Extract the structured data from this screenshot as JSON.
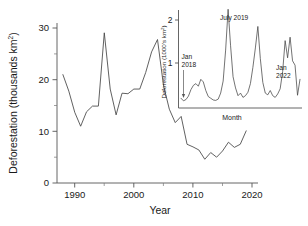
{
  "chart_data": [
    {
      "id": "main",
      "type": "line",
      "title": "",
      "xlabel": "Year",
      "ylabel": "Deforestation (thousands km²)",
      "ylabel_base": "Deforestation (thousands km",
      "ylabel_sup": "2",
      "ylabel_tail": ")",
      "xlim": [
        1987,
        2021
      ],
      "ylim": [
        0,
        31
      ],
      "xticks": [
        1990,
        2000,
        2010,
        2020
      ],
      "xtick_labels": [
        "1990",
        "2000",
        "2010",
        "2020"
      ],
      "xminorticks": [
        1995,
        2005,
        2015
      ],
      "yticks": [
        0,
        10,
        20,
        30
      ],
      "ytick_labels": [
        "0",
        "10",
        "20",
        "30"
      ],
      "yminorticks": [
        5,
        15,
        25
      ],
      "grid": false,
      "legend": "none",
      "x": [
        1988,
        1989,
        1990,
        1991,
        1992,
        1993,
        1994,
        1995,
        1996,
        1997,
        1998,
        1999,
        2000,
        2001,
        2002,
        2003,
        2004,
        2005,
        2006,
        2007,
        2008,
        2009,
        2010,
        2011,
        2012,
        2013,
        2014,
        2015,
        2016,
        2017,
        2018,
        2019
      ],
      "values": [
        21.0,
        17.8,
        13.7,
        11.0,
        13.8,
        14.9,
        14.9,
        29.1,
        18.2,
        13.2,
        17.4,
        17.3,
        18.2,
        18.2,
        21.4,
        25.4,
        27.8,
        19.0,
        14.3,
        11.7,
        12.9,
        7.5,
        7.0,
        6.4,
        4.6,
        5.9,
        5.0,
        6.2,
        7.9,
        6.9,
        7.5,
        10.1
      ]
    },
    {
      "id": "inset",
      "type": "line",
      "title": "",
      "xlabel": "Month",
      "ylabel": "Deforestation (1000's km²)",
      "ylabel_base": "Deforestation (1000's km",
      "ylabel_sup": "2",
      "ylabel_tail": ")",
      "ylim": [
        0,
        2.3
      ],
      "yticks": [
        1,
        2
      ],
      "ytick_labels": [
        "1",
        "2"
      ],
      "grid": false,
      "legend": "none",
      "annotations": [
        {
          "id": "jan-2018",
          "line1": "Jan",
          "line2": "2018"
        },
        {
          "id": "july-2019",
          "line1": "July 2019",
          "line2": ""
        },
        {
          "id": "jan-2022",
          "line1": "Jan",
          "line2": "2022"
        }
      ],
      "x_months": [
        "2018-01",
        "2018-02",
        "2018-03",
        "2018-04",
        "2018-05",
        "2018-06",
        "2018-07",
        "2018-08",
        "2018-09",
        "2018-10",
        "2018-11",
        "2018-12",
        "2019-01",
        "2019-02",
        "2019-03",
        "2019-04",
        "2019-05",
        "2019-06",
        "2019-07",
        "2019-08",
        "2019-09",
        "2019-10",
        "2019-11",
        "2019-12",
        "2020-01",
        "2020-02",
        "2020-03",
        "2020-04",
        "2020-05",
        "2020-06",
        "2020-07",
        "2020-08",
        "2020-09",
        "2020-10",
        "2020-11",
        "2020-12",
        "2021-01",
        "2021-02",
        "2021-03",
        "2021-04",
        "2021-05",
        "2021-06",
        "2021-07",
        "2021-08",
        "2021-09",
        "2021-10",
        "2021-11",
        "2021-12",
        "2022-01"
      ],
      "values": [
        0.18,
        0.12,
        0.15,
        0.23,
        0.38,
        0.48,
        0.52,
        0.46,
        0.62,
        0.56,
        0.36,
        0.22,
        0.18,
        0.14,
        0.13,
        0.16,
        0.3,
        0.58,
        1.3,
        2.25,
        1.4,
        0.68,
        0.42,
        0.24,
        0.3,
        0.2,
        0.24,
        0.32,
        0.52,
        0.9,
        1.35,
        1.85,
        1.1,
        0.55,
        0.3,
        0.26,
        0.36,
        0.24,
        0.2,
        0.28,
        0.4,
        0.8,
        1.52,
        1.12,
        1.6,
        1.05,
        0.95,
        0.25,
        0.62
      ]
    }
  ],
  "main_axis": {
    "xlabel": "Year",
    "ylabel_base": "Deforestation (thousands km",
    "ylabel_sup": "2",
    "ylabel_tail": ")",
    "xtick_labels": [
      "1990",
      "2000",
      "2010",
      "2020"
    ],
    "ytick_labels": [
      "0",
      "10",
      "20",
      "30"
    ]
  },
  "inset_axis": {
    "xlabel": "Month",
    "ylabel_base": "Deforestation (1000's km",
    "ylabel_sup": "2",
    "ylabel_tail": ")",
    "ytick_labels": [
      "1",
      "2"
    ]
  },
  "inset_annotations": {
    "jan2018_line1": "Jan",
    "jan2018_line2": "2018",
    "july2019": "July 2019",
    "jan2022_line1": "Jan",
    "jan2022_line2": "2022"
  }
}
